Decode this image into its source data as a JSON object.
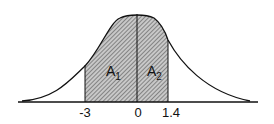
{
  "diagram": {
    "type": "normal-distribution-shaded-areas",
    "x_labels": [
      "-3",
      "0",
      "1.4"
    ],
    "areas": [
      {
        "label": "A",
        "subscript": "1",
        "from": "-3",
        "to": "0"
      },
      {
        "label": "A",
        "subscript": "2",
        "from": "0",
        "to": "1.4"
      }
    ],
    "colors": {
      "line": "#111111",
      "hatch": "#555555",
      "fill": "#bdbdbd"
    }
  }
}
